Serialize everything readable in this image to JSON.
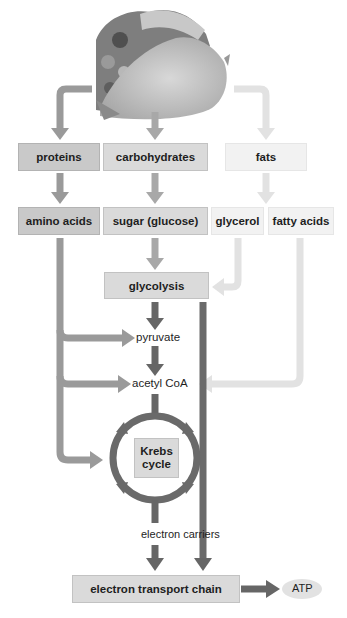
{
  "image": {
    "subject": "taco-icon",
    "description": "taco illustration (food source)"
  },
  "row1": {
    "proteins": "proteins",
    "carbohydrates": "carbohydrates",
    "fats": "fats"
  },
  "row2": {
    "amino_acids": "amino acids",
    "sugar": "sugar (glucose)",
    "glycerol": "glycerol",
    "fatty_acids": "fatty acids"
  },
  "pathway": {
    "glycolysis": "glycolysis",
    "pyruvate": "pyruvate",
    "acetyl_coa": "acetyl CoA",
    "krebs_line1": "Krebs",
    "krebs_line2": "cycle",
    "electron_carriers": "electron carriers",
    "etc": "electron transport chain",
    "atp": "ATP"
  },
  "colors": {
    "protein_arrow": "#9a9a9a",
    "carb_arrow": "#a8a8a8",
    "fat_arrow": "#e2e2e2",
    "core_arrow": "#666666",
    "krebs_ring": "#6a6a6a"
  }
}
